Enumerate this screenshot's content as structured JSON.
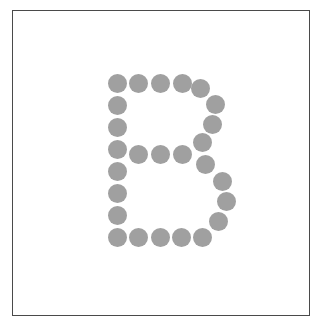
{
  "figure": {
    "letter": "B",
    "dot_color": "#a0a0a0",
    "frame_color": "#4a4a4a",
    "background_color": "#ffffff",
    "dot_diameter": 19,
    "frame": {
      "x": 12,
      "y": 10,
      "width": 298,
      "height": 306
    }
  },
  "dots": [
    {
      "x": 117,
      "y": 83
    },
    {
      "x": 138,
      "y": 83
    },
    {
      "x": 160,
      "y": 83
    },
    {
      "x": 182,
      "y": 83
    },
    {
      "x": 200,
      "y": 88
    },
    {
      "x": 215,
      "y": 104
    },
    {
      "x": 212,
      "y": 124
    },
    {
      "x": 202,
      "y": 142
    },
    {
      "x": 117,
      "y": 105
    },
    {
      "x": 117,
      "y": 127
    },
    {
      "x": 117,
      "y": 149
    },
    {
      "x": 117,
      "y": 171
    },
    {
      "x": 117,
      "y": 193
    },
    {
      "x": 117,
      "y": 215
    },
    {
      "x": 117,
      "y": 237
    },
    {
      "x": 138,
      "y": 154
    },
    {
      "x": 160,
      "y": 154
    },
    {
      "x": 182,
      "y": 154
    },
    {
      "x": 205,
      "y": 164
    },
    {
      "x": 222,
      "y": 181
    },
    {
      "x": 226,
      "y": 201
    },
    {
      "x": 218,
      "y": 221
    },
    {
      "x": 202,
      "y": 237
    },
    {
      "x": 138,
      "y": 237
    },
    {
      "x": 160,
      "y": 237
    },
    {
      "x": 181,
      "y": 237
    }
  ]
}
